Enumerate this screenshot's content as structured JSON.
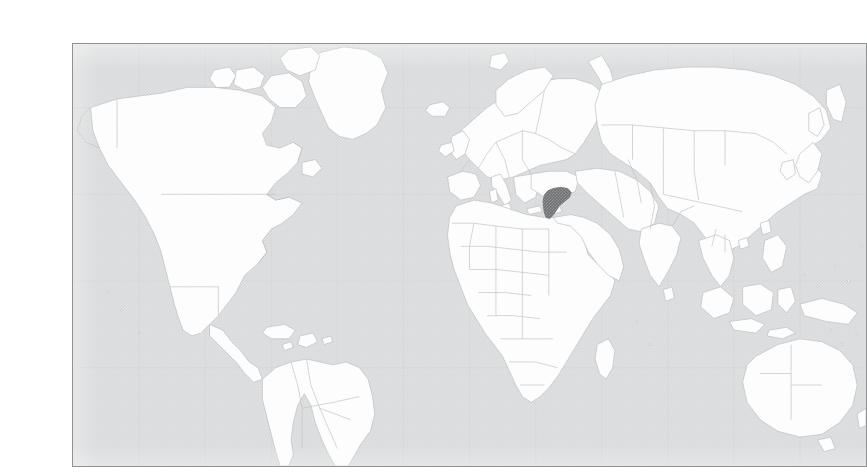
{
  "figure": {
    "kind": "locator-map",
    "caption": "",
    "frame": {
      "border_color": "#8f9193",
      "background_color": "#ffffff"
    }
  },
  "map": {
    "projection": "equirectangular",
    "lon_range": [
      -180,
      180
    ],
    "lat_range": [
      -62,
      84
    ],
    "graticule": {
      "visible": true,
      "spacing_degrees": 30,
      "color": "#cfd0d1"
    },
    "ocean_color": "#d9dadb",
    "land_color": "#fdfdfd",
    "border_color": "#b9babc",
    "highlight_color": "#6f7173",
    "labels": [],
    "legend": {
      "visible": false,
      "entries": []
    },
    "scale_bar": {
      "visible": false
    },
    "highlighted_regions": [
      {
        "name": "Syria",
        "color": "#6f7173",
        "centroid_lon": 38.5,
        "centroid_lat": 35.0
      }
    ],
    "visible_continents": [
      "North America",
      "South America",
      "Europe",
      "Africa",
      "Asia",
      "Australia"
    ]
  }
}
